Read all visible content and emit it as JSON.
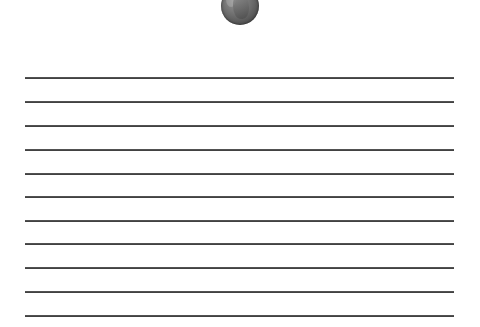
{
  "image": {
    "icon": "coin-icon",
    "description": "penny coin at top center"
  },
  "ruled_paper": {
    "line_count": 11,
    "line_y_positions": [
      77,
      101,
      125,
      149,
      173,
      196,
      220,
      243,
      267,
      291,
      315
    ],
    "line_color": "#444444",
    "background_color": "#ffffff"
  }
}
